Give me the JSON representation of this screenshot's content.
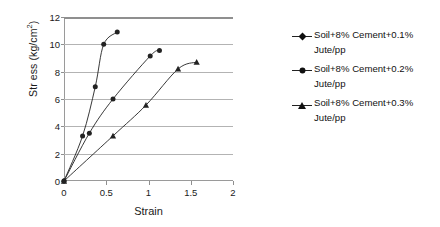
{
  "chart_data": {
    "type": "line",
    "title": "",
    "xlabel": "Strain",
    "ylabel": "Str ess (kg/cm2)",
    "ylabel_main": "Str ess (kg/cm",
    "ylabel_sup": "2",
    "ylabel_close": ")",
    "xlim": [
      0,
      2
    ],
    "ylim": [
      0,
      12
    ],
    "xticks": [
      "0",
      "0.5",
      "1",
      "1.5",
      "2"
    ],
    "xtick_values": [
      0,
      0.5,
      1,
      1.5,
      2
    ],
    "yticks": [
      "0",
      "2",
      "4",
      "6",
      "8",
      "10",
      "12"
    ],
    "ytick_values": [
      0,
      2,
      4,
      6,
      8,
      10,
      12
    ],
    "grid": "horizontal",
    "legend_position": "right",
    "series": [
      {
        "name": "Soil+8% Cement+0.1% Jute/pp",
        "marker": "diamond",
        "x": [
          0,
          0.22,
          0.37,
          0.47,
          0.63
        ],
        "y": [
          0,
          3.3,
          6.9,
          10.0,
          10.9
        ]
      },
      {
        "name": "Soil+8% Cement+0.2% Jute/pp",
        "marker": "circle",
        "x": [
          0,
          0.3,
          0.58,
          1.02,
          1.13
        ],
        "y": [
          0,
          3.5,
          6.0,
          9.15,
          9.55
        ]
      },
      {
        "name": "Soil+8% Cement+0.3% Jute/pp",
        "marker": "triangle",
        "x": [
          0,
          0.58,
          0.97,
          1.35,
          1.57
        ],
        "y": [
          0,
          3.3,
          5.55,
          8.2,
          8.7
        ]
      }
    ]
  },
  "legend": {
    "entries": [
      {
        "line1": "Soil+8% Cement+0.1%",
        "line2": "Jute/pp",
        "marker": "diamond"
      },
      {
        "line1": "Soil+8% Cement+0.2%",
        "line2": "Jute/pp",
        "marker": "circle"
      },
      {
        "line1": "Soil+8% Cement+0.3%",
        "line2": "Jute/pp",
        "marker": "triangle"
      }
    ]
  },
  "colors": {
    "series_line": "#222222",
    "gridline": "#b3b3b3",
    "axis": "#8f8f8f",
    "text": "#1a1a1a",
    "background": "#ffffff"
  }
}
